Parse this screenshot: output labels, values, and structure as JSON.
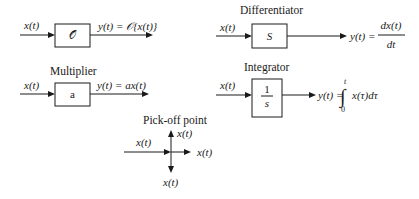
{
  "blocks": {
    "operator": {
      "input_label": "x(t)",
      "box_label": "𝒪",
      "output_label": "y(t) = 𝒪{x(t)}"
    },
    "multiplier": {
      "title": "Multiplier",
      "input_label": "x(t)",
      "box_label": "a",
      "output_label": "y(t) = ax(t)"
    },
    "differentiator": {
      "title": "Differentiator",
      "input_label": "x(t)",
      "box_label": "S",
      "output_lhs": "y(t) =",
      "output_numerator": "dx(t)",
      "output_denominator": "dt"
    },
    "integrator": {
      "title": "Integrator",
      "input_label": "x(t)",
      "box_numerator": "1",
      "box_denominator": "s",
      "output_lhs": "y(t) =",
      "integral_sign": "∫",
      "upper_limit": "t",
      "lower_limit": "0",
      "integrand": "x(τ)dτ"
    },
    "pickoff": {
      "title": "Pick-off point",
      "input_label": "x(t)",
      "up_label": "x(t)",
      "right_label": "x(t)",
      "down_label": "x(t)"
    }
  }
}
